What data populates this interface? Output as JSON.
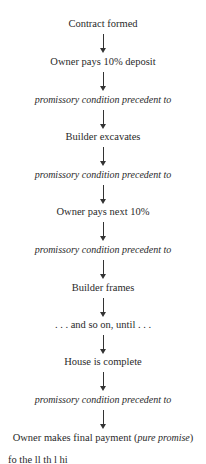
{
  "flow": {
    "steps": [
      {
        "text": "Contract formed",
        "italic": false
      },
      {
        "text": "Owner pays 10% deposit",
        "italic": false
      },
      {
        "text": "promissory condition precedent to",
        "italic": true
      },
      {
        "text": "Builder excavates",
        "italic": false
      },
      {
        "text": "promissory condition precedent to",
        "italic": true
      },
      {
        "text": "Owner pays next 10%",
        "italic": false
      },
      {
        "text": "promissory condition precedent to",
        "italic": true
      },
      {
        "text": "Builder frames",
        "italic": false
      },
      {
        "text": ". . . and so on, until . . .",
        "italic": false
      },
      {
        "text": "House is complete",
        "italic": false
      },
      {
        "text": "promissory condition precedent to",
        "italic": true
      },
      {
        "text": "Owner makes final payment (",
        "italic": false,
        "suffix_italic": "pure promise",
        "suffix_close": ")"
      }
    ],
    "arrow_count": 11
  },
  "trailing_text": "fo          the         ll              th           l     hi",
  "colors": {
    "text": "#2a2a2a",
    "arrow": "#333333",
    "background": "#ffffff"
  }
}
